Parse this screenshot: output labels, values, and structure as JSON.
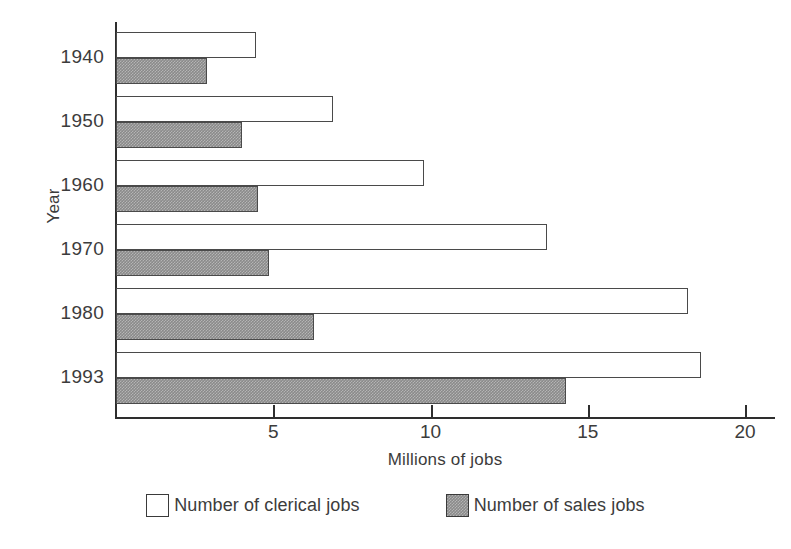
{
  "chart_data": {
    "type": "bar",
    "orientation": "horizontal",
    "title": "",
    "xlabel": "Millions of jobs",
    "ylabel": "Year",
    "categories": [
      "1940",
      "1950",
      "1960",
      "1970",
      "1980",
      "1993"
    ],
    "series": [
      {
        "name": "Number of clerical jobs",
        "values": [
          4.45,
          6.9,
          9.8,
          13.7,
          18.2,
          18.6
        ],
        "fill": "#ffffff",
        "stroke": "#4a4a4a"
      },
      {
        "name": "Number of sales jobs",
        "values": [
          2.9,
          4.0,
          4.5,
          4.85,
          6.3,
          14.3
        ],
        "fill": "#8a8a8a",
        "stroke": "#4a4a4a"
      }
    ],
    "xlim": [
      0,
      21
    ],
    "xticks": [
      5,
      10,
      15,
      20
    ],
    "xtick_labels": [
      "5",
      "10",
      "15",
      "20"
    ],
    "grid": false,
    "legend_position": "bottom"
  },
  "axes": {
    "y_title": "Year",
    "x_title": "Millions of jobs"
  },
  "legend": {
    "items": [
      {
        "label": "Number of clerical jobs",
        "swatch": "clerical-swatch"
      },
      {
        "label": "Number of sales jobs",
        "swatch": "sales-swatch"
      }
    ]
  }
}
